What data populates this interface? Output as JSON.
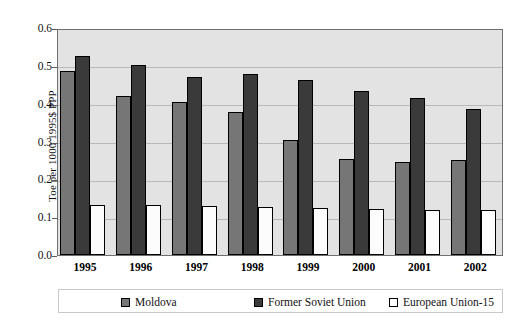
{
  "chart_data": {
    "type": "bar",
    "title": "",
    "xlabel": "",
    "ylabel": "Toe per 1000 1995$ PPP",
    "ylim": [
      0,
      0.6
    ],
    "yticks": [
      "0.0",
      "0.1",
      "0.2",
      "0.3",
      "0.4",
      "0.5",
      "0.6"
    ],
    "ytick_values": [
      0.0,
      0.1,
      0.2,
      0.3,
      0.4,
      0.5,
      0.6
    ],
    "grid": true,
    "legend_position": "bottom",
    "categories": [
      "1995",
      "1996",
      "1997",
      "1998",
      "1999",
      "2000",
      "2001",
      "2002"
    ],
    "series": [
      {
        "name": "Moldova",
        "color": "#767676",
        "values": [
          0.487,
          0.421,
          0.405,
          0.378,
          0.303,
          0.255,
          0.247,
          0.251
        ]
      },
      {
        "name": "Former Soviet Union",
        "color": "#3a3a3a",
        "values": [
          0.527,
          0.501,
          0.47,
          0.478,
          0.462,
          0.434,
          0.414,
          0.387
        ]
      },
      {
        "name": "European Union-15",
        "color": "#ffffff",
        "values": [
          0.131,
          0.131,
          0.13,
          0.127,
          0.123,
          0.121,
          0.12,
          0.118
        ]
      }
    ]
  },
  "legend": {
    "items": [
      {
        "label": "Moldova"
      },
      {
        "label": "Former Soviet Union"
      },
      {
        "label": "European Union-15"
      }
    ]
  }
}
